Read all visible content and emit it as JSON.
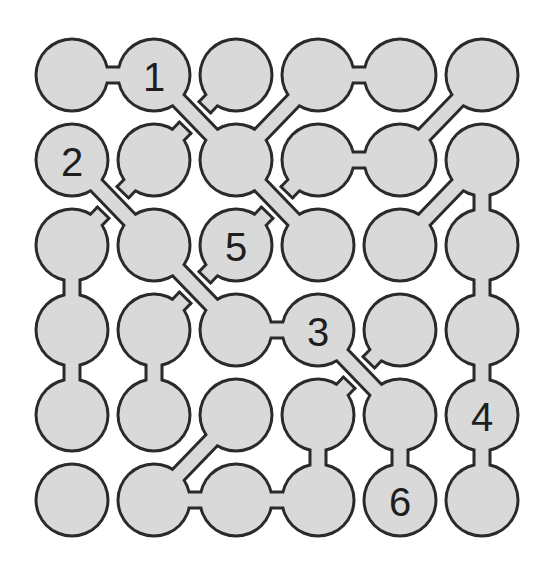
{
  "puzzle": {
    "type": "hashi-style circle connection puzzle",
    "rows": 6,
    "cols": 6,
    "colors": {
      "background": "#ffffff",
      "node_fill": "#d9d9d9",
      "stroke": "#2a2a2a",
      "number": "#1e1e1e"
    },
    "geometry": {
      "col_x": [
        72,
        154,
        236,
        318,
        400,
        482
      ],
      "row_y": [
        75,
        160,
        245,
        330,
        415,
        500
      ],
      "radius": 36,
      "link_width": 13
    },
    "numbers": [
      {
        "row": 0,
        "col": 1,
        "label": "1"
      },
      {
        "row": 1,
        "col": 0,
        "label": "2"
      },
      {
        "row": 3,
        "col": 3,
        "label": "3"
      },
      {
        "row": 4,
        "col": 5,
        "label": "4"
      },
      {
        "row": 2,
        "col": 2,
        "label": "5"
      },
      {
        "row": 5,
        "col": 4,
        "label": "6"
      }
    ],
    "links": [
      {
        "a": [
          0,
          0
        ],
        "b": [
          0,
          1
        ]
      },
      {
        "a": [
          0,
          3
        ],
        "b": [
          0,
          4
        ]
      },
      {
        "a": [
          1,
          3
        ],
        "b": [
          1,
          4
        ]
      },
      {
        "a": [
          3,
          2
        ],
        "b": [
          3,
          3
        ]
      },
      {
        "a": [
          5,
          1
        ],
        "b": [
          5,
          2
        ]
      },
      {
        "a": [
          5,
          2
        ],
        "b": [
          5,
          3
        ]
      },
      {
        "a": [
          2,
          0
        ],
        "b": [
          3,
          0
        ]
      },
      {
        "a": [
          3,
          0
        ],
        "b": [
          4,
          0
        ]
      },
      {
        "a": [
          3,
          1
        ],
        "b": [
          4,
          1
        ]
      },
      {
        "a": [
          1,
          5
        ],
        "b": [
          2,
          5
        ]
      },
      {
        "a": [
          2,
          5
        ],
        "b": [
          3,
          5
        ]
      },
      {
        "a": [
          3,
          5
        ],
        "b": [
          4,
          5
        ]
      },
      {
        "a": [
          4,
          5
        ],
        "b": [
          5,
          5
        ]
      },
      {
        "a": [
          4,
          3
        ],
        "b": [
          5,
          3
        ]
      },
      {
        "a": [
          4,
          4
        ],
        "b": [
          5,
          4
        ]
      },
      {
        "a": [
          0,
          1
        ],
        "b": [
          1,
          2
        ]
      },
      {
        "a": [
          1,
          2
        ],
        "b": [
          2,
          3
        ]
      },
      {
        "a": [
          1,
          0
        ],
        "b": [
          2,
          1
        ]
      },
      {
        "a": [
          2,
          1
        ],
        "b": [
          3,
          2
        ]
      },
      {
        "a": [
          3,
          3
        ],
        "b": [
          4,
          4
        ]
      },
      {
        "a": [
          1,
          2
        ],
        "b": [
          0,
          3
        ]
      },
      {
        "a": [
          1,
          4
        ],
        "b": [
          0,
          5
        ]
      },
      {
        "a": [
          2,
          4
        ],
        "b": [
          1,
          5
        ]
      },
      {
        "a": [
          5,
          1
        ],
        "b": [
          4,
          2
        ]
      }
    ],
    "stubs": [
      {
        "a": [
          0,
          2
        ],
        "b": [
          1,
          1
        ]
      },
      {
        "a": [
          1,
          1
        ],
        "b": [
          2,
          0
        ]
      },
      {
        "a": [
          1,
          3
        ],
        "b": [
          2,
          2
        ]
      },
      {
        "a": [
          2,
          2
        ],
        "b": [
          3,
          1
        ]
      },
      {
        "a": [
          3,
          4
        ],
        "b": [
          4,
          3
        ]
      }
    ]
  }
}
